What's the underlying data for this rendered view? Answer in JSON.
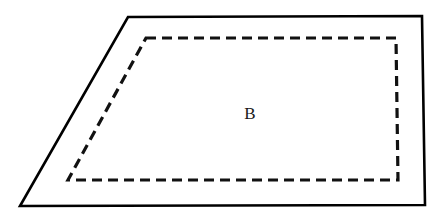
{
  "figure": {
    "background_color": "#ffffff",
    "canvas": {
      "width": 444,
      "height": 222
    },
    "outer_shape": {
      "name": "solid-quadrilateral",
      "style": "solid",
      "stroke_color": "#000000",
      "stroke_width": 2.6,
      "points": "128,17 422,16 425,205 20,206"
    },
    "inner_shape": {
      "name": "dashed-quadrilateral",
      "style": "dashed",
      "stroke_color": "#111111",
      "stroke_width": 3.2,
      "dash_pattern": "10 6",
      "points": "146,38 396,38 398,180 68,180"
    },
    "labels": [
      {
        "name": "region-label-b",
        "text": "B",
        "x": 250,
        "y": 115,
        "font_size": 17,
        "color": "#1a1a1a"
      }
    ]
  }
}
